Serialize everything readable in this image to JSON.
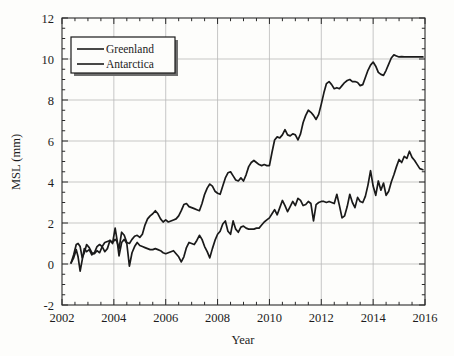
{
  "chart_data": {
    "type": "line",
    "title": "",
    "xlabel": "Year",
    "ylabel": "MSL (mm)",
    "xlim": [
      2002,
      2016
    ],
    "ylim": [
      -2,
      12
    ],
    "xticks": [
      2002,
      2004,
      2006,
      2008,
      2010,
      2012,
      2014,
      2016
    ],
    "xtick_labels": [
      "2002",
      "2004",
      "2006",
      "2008",
      "2010",
      "2012",
      "2014",
      "2016"
    ],
    "yticks": [
      -2,
      0,
      2,
      4,
      6,
      8,
      10,
      12
    ],
    "ytick_labels": [
      "-2",
      "0",
      "2",
      "4",
      "6",
      "8",
      "10",
      "12"
    ],
    "x_minor_step": 0.5,
    "y_minor_step": 0.5,
    "grid": true,
    "grid_color": "#b9b9b9",
    "legend_position": "upper left",
    "line_color": "#1a1a1a",
    "series": [
      {
        "name": "Greenland",
        "color": "#1a1a1a",
        "x": [
          2002.35,
          2002.45,
          2002.55,
          2002.62,
          2002.7,
          2002.78,
          2002.86,
          2002.95,
          2003.05,
          2003.15,
          2003.25,
          2003.35,
          2003.45,
          2003.55,
          2003.65,
          2003.75,
          2003.85,
          2003.95,
          2004.05,
          2004.12,
          2004.2,
          2004.3,
          2004.4,
          2004.5,
          2004.6,
          2004.7,
          2004.8,
          2004.9,
          2005.0,
          2005.1,
          2005.2,
          2005.3,
          2005.4,
          2005.5,
          2005.6,
          2005.7,
          2005.8,
          2005.9,
          2006.0,
          2006.1,
          2006.2,
          2006.3,
          2006.4,
          2006.5,
          2006.6,
          2006.7,
          2006.8,
          2006.9,
          2007.0,
          2007.1,
          2007.2,
          2007.3,
          2007.4,
          2007.5,
          2007.6,
          2007.7,
          2007.8,
          2007.9,
          2008.0,
          2008.1,
          2008.2,
          2008.3,
          2008.4,
          2008.5,
          2008.6,
          2008.7,
          2008.8,
          2008.9,
          2009.0,
          2009.1,
          2009.2,
          2009.3,
          2009.4,
          2009.5,
          2009.6,
          2009.7,
          2009.8,
          2009.9,
          2010.0,
          2010.1,
          2010.2,
          2010.3,
          2010.4,
          2010.5,
          2010.6,
          2010.7,
          2010.8,
          2010.9,
          2011.0,
          2011.1,
          2011.2,
          2011.3,
          2011.4,
          2011.5,
          2011.6,
          2011.7,
          2011.8,
          2011.9,
          2012.0,
          2012.1,
          2012.2,
          2012.3,
          2012.4,
          2012.5,
          2012.6,
          2012.7,
          2012.8,
          2012.9,
          2013.0,
          2013.1,
          2013.2,
          2013.3,
          2013.4,
          2013.5,
          2013.6,
          2013.7,
          2013.8,
          2013.9,
          2014.0,
          2014.1,
          2014.2,
          2014.3,
          2014.4,
          2014.5,
          2014.6,
          2014.7,
          2014.8,
          2014.9,
          2015.0,
          2015.1,
          2015.2,
          2015.3,
          2015.4,
          2015.5,
          2015.6,
          2015.7,
          2015.8,
          2015.92
        ],
        "y": [
          0.05,
          0.45,
          0.95,
          1.0,
          0.85,
          0.3,
          0.55,
          0.95,
          0.8,
          0.55,
          0.5,
          0.65,
          0.55,
          0.85,
          1.05,
          1.1,
          1.15,
          1.05,
          1.2,
          1.1,
          0.75,
          1.55,
          1.4,
          1.05,
          1.0,
          1.2,
          1.35,
          1.4,
          1.3,
          1.45,
          1.9,
          2.2,
          2.35,
          2.45,
          2.6,
          2.45,
          2.2,
          2.05,
          2.15,
          2.05,
          2.1,
          2.15,
          2.2,
          2.35,
          2.6,
          2.9,
          2.95,
          2.8,
          2.75,
          2.7,
          2.65,
          2.6,
          2.95,
          3.4,
          3.7,
          3.9,
          3.8,
          3.55,
          3.45,
          3.4,
          3.8,
          4.2,
          4.45,
          4.5,
          4.3,
          4.1,
          4.05,
          4.2,
          4.05,
          4.35,
          4.75,
          4.95,
          5.05,
          4.95,
          4.85,
          4.8,
          4.85,
          4.8,
          4.8,
          5.45,
          6.05,
          6.2,
          6.15,
          6.3,
          6.55,
          6.3,
          6.25,
          6.35,
          6.3,
          6.05,
          6.35,
          6.9,
          7.25,
          7.5,
          7.4,
          7.25,
          7.05,
          7.3,
          7.8,
          8.35,
          8.8,
          8.9,
          8.75,
          8.55,
          8.6,
          8.55,
          8.7,
          8.85,
          8.95,
          9.0,
          8.9,
          8.9,
          8.85,
          8.7,
          8.75,
          9.1,
          9.45,
          9.7,
          9.85,
          9.65,
          9.35,
          9.25,
          9.2,
          9.45,
          9.75,
          10.05,
          10.2,
          10.15,
          10.1,
          10.12,
          10.1,
          10.1,
          10.1,
          10.1,
          10.1,
          10.1,
          10.1,
          10.1
        ]
      },
      {
        "name": "Antarctica",
        "color": "#1a1a1a",
        "x": [
          2002.35,
          2002.45,
          2002.55,
          2002.62,
          2002.7,
          2002.78,
          2002.86,
          2002.95,
          2003.05,
          2003.15,
          2003.25,
          2003.35,
          2003.45,
          2003.55,
          2003.65,
          2003.75,
          2003.85,
          2003.95,
          2004.05,
          2004.12,
          2004.2,
          2004.3,
          2004.4,
          2004.5,
          2004.6,
          2004.7,
          2004.8,
          2004.9,
          2005.0,
          2005.1,
          2005.2,
          2005.3,
          2005.4,
          2005.5,
          2005.6,
          2005.7,
          2005.8,
          2005.9,
          2006.0,
          2006.1,
          2006.2,
          2006.3,
          2006.4,
          2006.5,
          2006.6,
          2006.7,
          2006.8,
          2006.9,
          2007.0,
          2007.1,
          2007.2,
          2007.3,
          2007.4,
          2007.5,
          2007.6,
          2007.7,
          2007.8,
          2007.9,
          2008.0,
          2008.1,
          2008.2,
          2008.3,
          2008.4,
          2008.5,
          2008.6,
          2008.7,
          2008.8,
          2008.9,
          2009.0,
          2009.1,
          2009.2,
          2009.3,
          2009.4,
          2009.5,
          2009.6,
          2009.7,
          2009.8,
          2009.9,
          2010.0,
          2010.1,
          2010.2,
          2010.3,
          2010.4,
          2010.5,
          2010.6,
          2010.7,
          2010.8,
          2010.9,
          2011.0,
          2011.1,
          2011.2,
          2011.3,
          2011.4,
          2011.5,
          2011.6,
          2011.7,
          2011.8,
          2011.9,
          2012.0,
          2012.1,
          2012.2,
          2012.3,
          2012.4,
          2012.5,
          2012.6,
          2012.7,
          2012.8,
          2012.9,
          2013.0,
          2013.1,
          2013.2,
          2013.3,
          2013.4,
          2013.5,
          2013.6,
          2013.7,
          2013.8,
          2013.9,
          2014.0,
          2014.1,
          2014.2,
          2014.3,
          2014.4,
          2014.5,
          2014.6,
          2014.7,
          2014.8,
          2014.9,
          2015.0,
          2015.1,
          2015.2,
          2015.3,
          2015.4,
          2015.5,
          2015.6,
          2015.7,
          2015.8,
          2015.92
        ],
        "y": [
          0.05,
          0.3,
          0.7,
          0.35,
          -0.35,
          0.2,
          0.75,
          0.6,
          0.7,
          0.45,
          0.55,
          0.85,
          0.95,
          0.85,
          0.6,
          0.75,
          1.15,
          1.0,
          1.75,
          1.2,
          0.4,
          1.05,
          1.2,
          1.0,
          -0.1,
          0.55,
          0.85,
          1.05,
          0.9,
          0.85,
          0.8,
          0.75,
          0.7,
          0.7,
          0.75,
          0.7,
          0.65,
          0.55,
          0.5,
          0.55,
          0.6,
          0.65,
          0.5,
          0.35,
          0.1,
          0.35,
          0.8,
          1.05,
          1.0,
          0.95,
          1.15,
          1.4,
          1.2,
          0.85,
          0.6,
          0.3,
          0.75,
          1.15,
          1.45,
          1.6,
          1.95,
          2.1,
          1.6,
          1.45,
          2.1,
          1.7,
          1.55,
          1.8,
          1.85,
          1.75,
          1.7,
          1.7,
          1.7,
          1.75,
          1.75,
          1.9,
          2.05,
          2.15,
          2.25,
          2.45,
          2.65,
          2.4,
          2.75,
          3.1,
          2.85,
          2.55,
          2.8,
          3.05,
          2.85,
          3.2,
          3.1,
          2.85,
          2.9,
          3.05,
          2.95,
          2.1,
          2.9,
          3.0,
          3.05,
          3.05,
          3.0,
          3.05,
          3.0,
          2.95,
          3.4,
          2.85,
          2.25,
          2.35,
          2.8,
          3.4,
          3.0,
          2.75,
          3.25,
          3.05,
          3.0,
          3.3,
          3.85,
          4.55,
          3.8,
          3.35,
          4.05,
          3.6,
          3.95,
          3.35,
          3.55,
          4.0,
          4.35,
          4.75,
          5.1,
          4.95,
          5.25,
          5.15,
          5.5,
          5.2,
          5.05,
          4.85,
          4.65,
          4.6
        ]
      }
    ]
  },
  "legend": {
    "items": [
      {
        "label": "Greenland"
      },
      {
        "label": "Antarctica"
      }
    ]
  }
}
